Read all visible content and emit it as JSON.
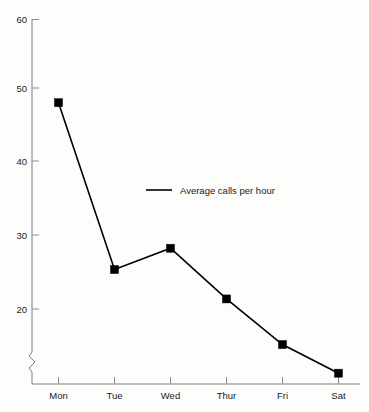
{
  "chart_data": {
    "type": "line",
    "title": "",
    "subtitle": "",
    "xlabel": "",
    "ylabel": "",
    "categories": [
      "Mon",
      "Tue",
      "Wed",
      "Thur",
      "Fri",
      "Sat"
    ],
    "series": [
      {
        "name": "Average calls per hour",
        "values": [
          48.0,
          25.3,
          28.2,
          21.3,
          15.1,
          11.2
        ],
        "color": "#000000",
        "marker": "square"
      }
    ],
    "ylim": [
      10,
      60
    ],
    "yticks": [
      20,
      30,
      40,
      50,
      60
    ],
    "ytick_labels": [
      "20",
      "30",
      "40",
      "50",
      "60"
    ],
    "xtick_labels": [
      "Mon",
      "Tue",
      "Wed",
      "Thur",
      "Fri",
      "Sat"
    ],
    "grid": false,
    "axis_break": true,
    "axis_break_axis": "y",
    "legend": {
      "entries": [
        "Average calls per hour"
      ],
      "position": "inside-center"
    }
  },
  "legend": {
    "entry_label": "Average calls per hour"
  },
  "axes": {
    "y_labels": [
      "60",
      "50",
      "40",
      "30",
      "20"
    ],
    "x_labels": [
      "Mon",
      "Tue",
      "Wed",
      "Thur",
      "Fri",
      "Sat"
    ]
  },
  "colors": {
    "series": "#000000",
    "axis": "#7d7d7d",
    "text": "#1a1a1a",
    "background": "#fdfdfc"
  }
}
